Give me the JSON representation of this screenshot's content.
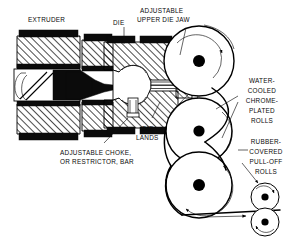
{
  "figure": {
    "background_color": "#ffffff",
    "ink_color": "#000000",
    "width": 304,
    "height": 243
  },
  "labels": {
    "extruder": "EXTRUDER",
    "die": "DIE",
    "adjustable_upper_die_jaw_line1": "ADJUSTABLE",
    "adjustable_upper_die_jaw_line2": "UPPER DIE JAW",
    "die_lands_line1": "DIE",
    "die_lands_line2": "LANDS",
    "adjustable_choke_line1": "ADJUSTABLE CHOKE,",
    "adjustable_choke_line2": "OR RESTRICTOR, BAR",
    "water_cooled_line1": "WATER-",
    "water_cooled_line2": "COOLED",
    "water_cooled_line3": "CHROME-",
    "water_cooled_line4": "PLATED",
    "water_cooled_line5": "ROLLS",
    "rubber_covered_line1": "RUBBER-",
    "rubber_covered_line2": "COVERED",
    "rubber_covered_line3": "PULL-OFF",
    "rubber_covered_line4": "ROLLS"
  },
  "components": {
    "chrome_rolls": [
      {
        "name": "top-chrome-roll",
        "cx": 199,
        "cy": 61,
        "r": 35
      },
      {
        "name": "middle-chrome-roll",
        "cx": 199,
        "cy": 131,
        "r": 33
      },
      {
        "name": "bottom-chrome-roll",
        "cx": 199,
        "cy": 185,
        "r": 33
      }
    ],
    "pull_off_rolls": [
      {
        "name": "upper-pull-off-roll",
        "cx": 265,
        "cy": 197,
        "r": 14
      },
      {
        "name": "lower-pull-off-roll",
        "cx": 265,
        "cy": 222,
        "r": 14
      }
    ]
  }
}
